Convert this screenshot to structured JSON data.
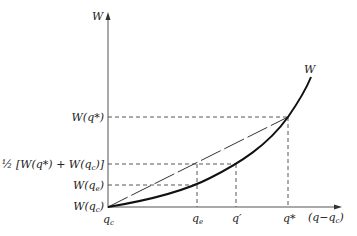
{
  "diagram": {
    "type": "welfare curve with chord (convexity illustration)",
    "axes": {
      "y_label": "W",
      "x_label": "(q−q",
      "x_label_sub": "c",
      "x_label_close": ")",
      "origin_label": "q",
      "origin_label_sub": "c"
    },
    "curve_label": "W",
    "y_ticks": [
      {
        "id": "w_qstar",
        "text": "W(q*)"
      },
      {
        "id": "half",
        "text": "½ [W(q*) + W(q",
        "sub": "c",
        "close": ")]"
      },
      {
        "id": "w_qe",
        "text": "W(q",
        "sub": "e",
        "close": ")"
      },
      {
        "id": "w_qc",
        "text": "W(q",
        "sub": "c",
        "close": ")"
      }
    ],
    "x_ticks": [
      {
        "id": "qe",
        "text": "q",
        "sub": "e"
      },
      {
        "id": "qprime",
        "text": "q′"
      },
      {
        "id": "qstar",
        "text": "q*"
      }
    ],
    "colors": {
      "curve": "#111111",
      "axes": "#555555",
      "dashed": "#444444"
    }
  }
}
